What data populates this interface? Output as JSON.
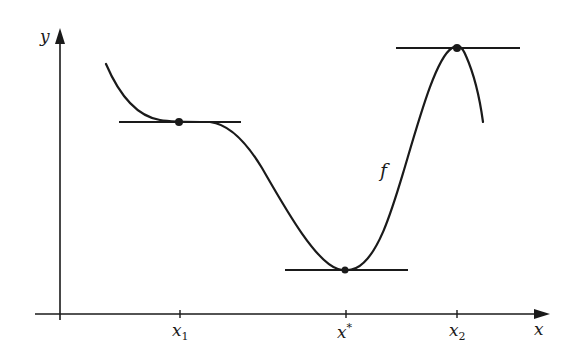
{
  "axes": {
    "y_label": "y",
    "x_label": "x"
  },
  "ticks": [
    {
      "base": "x",
      "sub": "1",
      "sup": ""
    },
    {
      "base": "x",
      "sub": "",
      "sup": "*"
    },
    {
      "base": "x",
      "sub": "2",
      "sup": ""
    }
  ],
  "curve_label": "f",
  "colors": {
    "ink": "#1a1a1a",
    "background": "#ffffff"
  },
  "points": [
    {
      "name": "saddle-point",
      "x": "x1"
    },
    {
      "name": "global-minimum",
      "x": "x*"
    },
    {
      "name": "local-maximum",
      "x": "x2"
    }
  ]
}
